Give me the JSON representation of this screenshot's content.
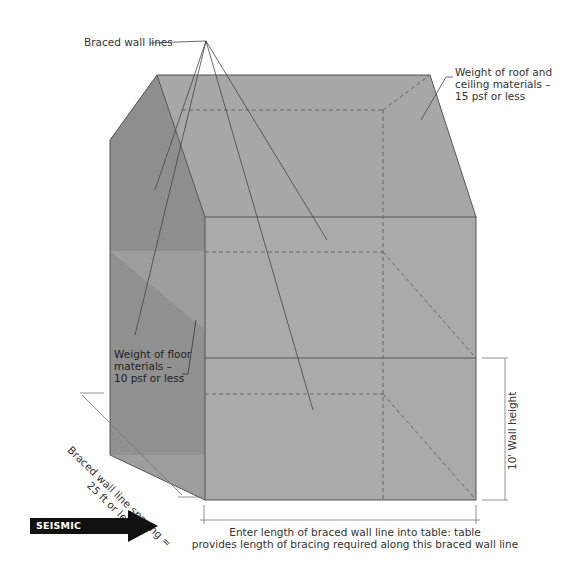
{
  "diagram": {
    "labels": {
      "braced_wall_lines": "Braced wall lines",
      "roof_weight": [
        "Weight of roof and",
        "ceiling materials –",
        "15 psf or less"
      ],
      "floor_weight": [
        "Weight of floor",
        "materials –",
        "10 psf or less"
      ],
      "spacing": [
        "Braced wall line spacing =",
        "25 ft or less"
      ],
      "wall_height": "10' Wall height",
      "enter_length": [
        "Enter  length of braced wall line into table: table",
        "provides length of bracing required along this braced wall line"
      ],
      "seismic_direction": "SEISMIC DIRECTION"
    },
    "colors": {
      "face_front": "#a9a9a9",
      "face_top": "#a6a6a6",
      "face_left_dark": "#8f8f8f",
      "face_left_light": "#9c9c9c",
      "edge": "#555555",
      "dashed": "#666666",
      "arrow": "#111111"
    }
  }
}
